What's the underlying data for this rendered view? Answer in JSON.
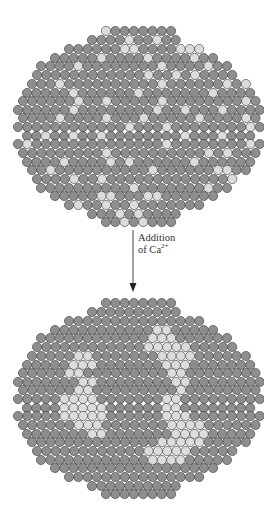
{
  "arrow_label": {
    "line1": "Addition",
    "line2_prefix": "of Ca",
    "line2_sup": "2+"
  },
  "colors": {
    "dark": "#8e8e8e",
    "light": "#dcdcdc",
    "stroke": "#3a3a3a",
    "arrow": "#333333"
  },
  "geometry": {
    "pitch": 9.3,
    "radius": 4.6
  },
  "clusters": [
    {
      "name": "membrane-before",
      "rows": [
        [
          31,
          106,
          8
        ],
        [
          40,
          92,
          10
        ],
        [
          49,
          69,
          15
        ],
        [
          58,
          55,
          18
        ],
        [
          66,
          41,
          21
        ],
        [
          75,
          37,
          22
        ],
        [
          84,
          32,
          24
        ],
        [
          93,
          27,
          25
        ],
        [
          101,
          23,
          26
        ],
        [
          110,
          18,
          27
        ],
        [
          118,
          23,
          26
        ],
        [
          127,
          18,
          27
        ],
        [
          136,
          27,
          25
        ],
        [
          144,
          18,
          27
        ],
        [
          153,
          23,
          26
        ],
        [
          162,
          27,
          25
        ],
        [
          170,
          32,
          24
        ],
        [
          179,
          37,
          22
        ],
        [
          188,
          41,
          21
        ],
        [
          196,
          55,
          18
        ],
        [
          205,
          69,
          15
        ],
        [
          214,
          92,
          10
        ],
        [
          222,
          106,
          8
        ]
      ],
      "light": [
        [
          0,
          0
        ],
        [
          1,
          4
        ],
        [
          1,
          7
        ],
        [
          2,
          6
        ],
        [
          2,
          7
        ],
        [
          2,
          12
        ],
        [
          2,
          13
        ],
        [
          2,
          14
        ],
        [
          3,
          5
        ],
        [
          3,
          10
        ],
        [
          3,
          15
        ],
        [
          4,
          4
        ],
        [
          4,
          13
        ],
        [
          4,
          18
        ],
        [
          5,
          12
        ],
        [
          5,
          15
        ],
        [
          5,
          17
        ],
        [
          6,
          3
        ],
        [
          6,
          14
        ],
        [
          6,
          21
        ],
        [
          6,
          23
        ],
        [
          7,
          5
        ],
        [
          7,
          12
        ],
        [
          7,
          20
        ],
        [
          8,
          6
        ],
        [
          8,
          9
        ],
        [
          8,
          15
        ],
        [
          8,
          24
        ],
        [
          9,
          6
        ],
        [
          9,
          15
        ],
        [
          9,
          18
        ],
        [
          9,
          22
        ],
        [
          10,
          4
        ],
        [
          10,
          9
        ],
        [
          10,
          13
        ],
        [
          10,
          19
        ],
        [
          10,
          24
        ],
        [
          11,
          12
        ],
        [
          11,
          16
        ],
        [
          11,
          25
        ],
        [
          12,
          2
        ],
        [
          12,
          5
        ],
        [
          12,
          8
        ],
        [
          12,
          17
        ],
        [
          12,
          21
        ],
        [
          13,
          1
        ],
        [
          13,
          16
        ],
        [
          13,
          25
        ],
        [
          14,
          9
        ],
        [
          14,
          20
        ],
        [
          14,
          22
        ],
        [
          15,
          4
        ],
        [
          15,
          9
        ],
        [
          15,
          11
        ],
        [
          15,
          18
        ],
        [
          16,
          2
        ],
        [
          16,
          13
        ],
        [
          16,
          20
        ],
        [
          16,
          21
        ],
        [
          17,
          4
        ],
        [
          17,
          7
        ],
        [
          17,
          21
        ],
        [
          18,
          10
        ],
        [
          18,
          18
        ],
        [
          19,
          5
        ],
        [
          19,
          6
        ],
        [
          19,
          10
        ],
        [
          19,
          11
        ],
        [
          20,
          1
        ],
        [
          20,
          4
        ],
        [
          20,
          7
        ],
        [
          21,
          3
        ],
        [
          21,
          5
        ],
        [
          22,
          2
        ],
        [
          22,
          4
        ]
      ]
    },
    {
      "name": "membrane-after",
      "rows": [
        [
          303,
          106,
          8
        ],
        [
          312,
          92,
          10
        ],
        [
          321,
          69,
          15
        ],
        [
          330,
          55,
          18
        ],
        [
          338,
          41,
          21
        ],
        [
          347,
          37,
          22
        ],
        [
          356,
          32,
          24
        ],
        [
          365,
          27,
          25
        ],
        [
          373,
          23,
          26
        ],
        [
          382,
          18,
          27
        ],
        [
          390,
          23,
          26
        ],
        [
          399,
          18,
          27
        ],
        [
          408,
          27,
          25
        ],
        [
          416,
          18,
          27
        ],
        [
          425,
          23,
          26
        ],
        [
          434,
          27,
          25
        ],
        [
          442,
          32,
          24
        ],
        [
          451,
          37,
          22
        ],
        [
          460,
          41,
          21
        ],
        [
          468,
          55,
          18
        ],
        [
          477,
          69,
          15
        ],
        [
          486,
          92,
          10
        ],
        [
          494,
          106,
          8
        ]
      ],
      "light": [
        [
          3,
          11
        ],
        [
          3,
          12
        ],
        [
          4,
          12
        ],
        [
          4,
          13
        ],
        [
          4,
          14
        ],
        [
          5,
          12
        ],
        [
          5,
          13
        ],
        [
          5,
          14
        ],
        [
          5,
          15
        ],
        [
          5,
          16
        ],
        [
          6,
          5
        ],
        [
          6,
          6
        ],
        [
          6,
          14
        ],
        [
          6,
          15
        ],
        [
          6,
          16
        ],
        [
          6,
          17
        ],
        [
          7,
          5
        ],
        [
          7,
          6
        ],
        [
          7,
          7
        ],
        [
          7,
          15
        ],
        [
          7,
          16
        ],
        [
          7,
          17
        ],
        [
          8,
          5
        ],
        [
          8,
          6
        ],
        [
          8,
          16
        ],
        [
          8,
          17
        ],
        [
          9,
          7
        ],
        [
          9,
          8
        ],
        [
          9,
          17
        ],
        [
          9,
          18
        ],
        [
          10,
          6
        ],
        [
          10,
          7
        ],
        [
          10,
          17
        ],
        [
          11,
          5
        ],
        [
          11,
          6
        ],
        [
          11,
          7
        ],
        [
          11,
          8
        ],
        [
          11,
          16
        ],
        [
          11,
          17
        ],
        [
          12,
          4
        ],
        [
          12,
          5
        ],
        [
          12,
          6
        ],
        [
          12,
          7
        ],
        [
          12,
          8
        ],
        [
          12,
          15
        ],
        [
          12,
          16
        ],
        [
          13,
          5
        ],
        [
          13,
          6
        ],
        [
          13,
          7
        ],
        [
          13,
          8
        ],
        [
          13,
          9
        ],
        [
          13,
          16
        ],
        [
          13,
          17
        ],
        [
          13,
          18
        ],
        [
          14,
          6
        ],
        [
          14,
          7
        ],
        [
          14,
          8
        ],
        [
          14,
          16
        ],
        [
          14,
          17
        ],
        [
          14,
          18
        ],
        [
          14,
          19
        ],
        [
          15,
          7
        ],
        [
          15,
          8
        ],
        [
          15,
          16
        ],
        [
          15,
          17
        ],
        [
          15,
          18
        ],
        [
          15,
          19
        ],
        [
          16,
          14
        ],
        [
          16,
          15
        ],
        [
          16,
          16
        ],
        [
          16,
          17
        ],
        [
          16,
          18
        ],
        [
          17,
          12
        ],
        [
          17,
          13
        ],
        [
          17,
          14
        ],
        [
          17,
          15
        ],
        [
          17,
          16
        ],
        [
          18,
          12
        ],
        [
          18,
          13
        ],
        [
          18,
          14
        ],
        [
          18,
          15
        ]
      ]
    }
  ]
}
